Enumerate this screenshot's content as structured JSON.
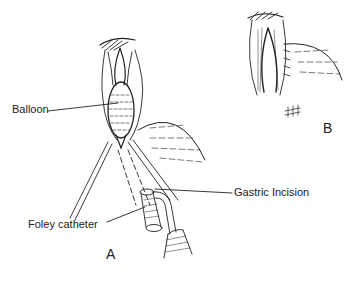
{
  "figure": {
    "panels": [
      {
        "id": "A",
        "label": "A"
      },
      {
        "id": "B",
        "label": "B"
      }
    ],
    "labels": {
      "balloon": "Balloon",
      "gastric_incision": "Gastric Incision",
      "foley_catheter": "Foley catheter"
    },
    "colors": {
      "line": "#222222",
      "background": "#ffffff"
    }
  }
}
